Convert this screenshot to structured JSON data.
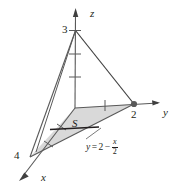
{
  "figure": {
    "type": "3d-coordinate-diagram",
    "colors": {
      "line": "#595959",
      "edge_dark": "#404040",
      "fill": "#d9d9d9",
      "text": "#231f20",
      "thick_segment": "#231f20"
    },
    "axes": {
      "z": {
        "label": "z",
        "intercept_label": "3",
        "ticks": [
          1,
          2,
          3
        ],
        "direction": "up"
      },
      "y": {
        "label": "y",
        "intercept_label": "2",
        "ticks": [
          1,
          2
        ],
        "direction": "right"
      },
      "x": {
        "label": "x",
        "intercept_label": "4",
        "ticks": [
          1,
          2,
          3,
          4
        ],
        "direction": "down-left"
      }
    },
    "region": {
      "label": "S",
      "boundary_equation": {
        "lhs": "y",
        "operator": "=",
        "constant": "2",
        "minus": "−",
        "fraction_numerator": "x",
        "fraction_denominator": "2"
      }
    },
    "vertices": {
      "origin": "(0, 0, 0)",
      "z_apex": "(0, 0, 3)",
      "y_point": "(0, 2, 0)",
      "x_point": "(4, 0, 0)"
    }
  }
}
